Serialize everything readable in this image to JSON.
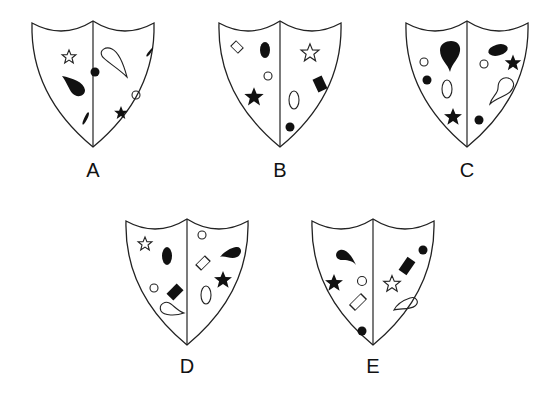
{
  "figure": {
    "shields": [
      {
        "id": "A",
        "label": "A",
        "x": 32,
        "y": 20
      },
      {
        "id": "B",
        "label": "B",
        "x": 219,
        "y": 20
      },
      {
        "id": "C",
        "label": "C",
        "x": 406,
        "y": 20
      },
      {
        "id": "D",
        "label": "D",
        "x": 126,
        "y": 218
      },
      {
        "id": "E",
        "label": "E",
        "x": 312,
        "y": 218
      }
    ],
    "colors": {
      "stroke": "#222222",
      "fill": "#111111",
      "background": "#ffffff"
    }
  }
}
